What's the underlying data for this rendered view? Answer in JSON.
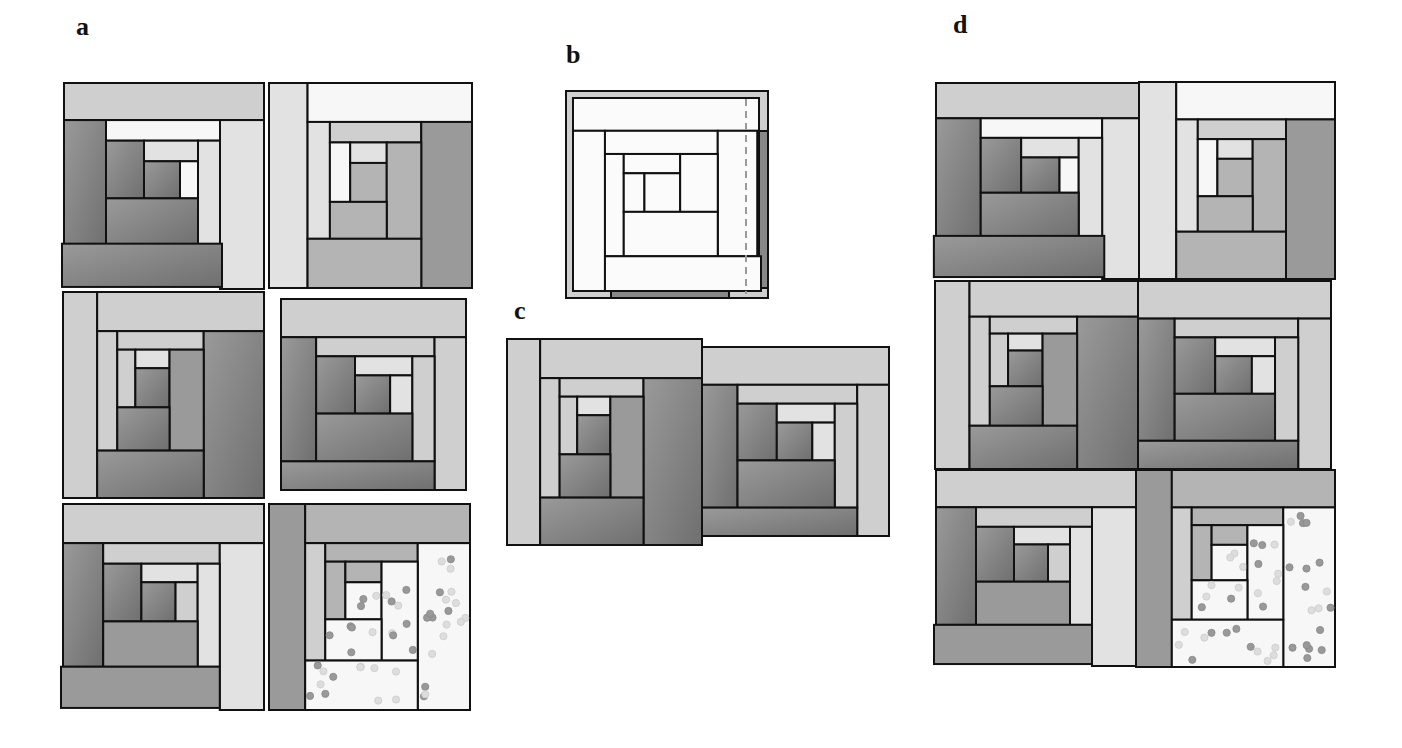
{
  "figure": {
    "labels": [
      {
        "id": "a",
        "text": "a",
        "x": 76,
        "y": 14
      },
      {
        "id": "b",
        "text": "b",
        "x": 566,
        "y": 42
      },
      {
        "id": "c",
        "text": "c",
        "x": 514,
        "y": 298
      },
      {
        "id": "d",
        "text": "d",
        "x": 953,
        "y": 12
      }
    ],
    "colors": {
      "white": "#f7f7f7",
      "pale": "#e2e2e2",
      "light": "#cfcfcf",
      "mid": "#b4b4b4",
      "midDark": "#9a9a9a",
      "dark": "#858585",
      "darker": "#777777",
      "outline": "#111111",
      "dotDark": "#999999",
      "dotLight": "#dddddd",
      "dashed": "#999999"
    },
    "panels": {
      "a": {
        "description": "Six individual log-cabin quilt blocks",
        "blocks": [
          {
            "name": "block-a1",
            "x": 64,
            "y": 83,
            "w": 200,
            "h": 206,
            "variant": "A"
          },
          {
            "name": "block-a2",
            "x": 269,
            "y": 83,
            "w": 203,
            "h": 205,
            "variant": "B"
          },
          {
            "name": "block-a3",
            "x": 63,
            "y": 292,
            "w": 201,
            "h": 206,
            "variant": "C"
          },
          {
            "name": "block-a4",
            "x": 281,
            "y": 299,
            "w": 185,
            "h": 191,
            "variant": "D"
          },
          {
            "name": "block-a5",
            "x": 63,
            "y": 504,
            "w": 201,
            "h": 206,
            "variant": "E"
          },
          {
            "name": "block-a6",
            "x": 269,
            "y": 504,
            "w": 201,
            "h": 206,
            "variant": "F"
          }
        ]
      },
      "b": {
        "description": "Single block outline with seam allowance and dashed cutting line",
        "x": 566,
        "y": 91,
        "w": 202,
        "h": 207
      },
      "c": {
        "description": "Two blocks joined side by side",
        "blocks": [
          {
            "name": "block-c1",
            "x": 507,
            "y": 339,
            "w": 195,
            "h": 206,
            "variant": "C"
          },
          {
            "name": "block-c2",
            "x": 702,
            "y": 347,
            "w": 187,
            "h": 189,
            "variant": "D"
          }
        ]
      },
      "d": {
        "description": "Six blocks assembled into a 2x3 quilt",
        "blocks": [
          {
            "name": "block-d1",
            "x": 936,
            "y": 83,
            "w": 213,
            "h": 196,
            "variant": "A"
          },
          {
            "name": "block-d2",
            "x": 1139,
            "y": 82,
            "w": 196,
            "h": 197,
            "variant": "B"
          },
          {
            "name": "block-d3",
            "x": 935,
            "y": 281,
            "w": 203,
            "h": 188,
            "variant": "C"
          },
          {
            "name": "block-d4",
            "x": 1138,
            "y": 281,
            "w": 193,
            "h": 188,
            "variant": "D"
          },
          {
            "name": "block-d5",
            "x": 936,
            "y": 470,
            "w": 200,
            "h": 196,
            "variant": "E"
          },
          {
            "name": "block-d6",
            "x": 1136,
            "y": 470,
            "w": 199,
            "h": 197,
            "variant": "F"
          }
        ]
      }
    },
    "variants": {
      "A": [
        [
          0,
          0,
          1,
          0.18,
          "light"
        ],
        [
          0,
          0.18,
          0.21,
          0.62,
          "darker"
        ],
        [
          0.21,
          0.18,
          0.57,
          0.1,
          "white"
        ],
        [
          0.78,
          0.18,
          0.22,
          0.82,
          "pale"
        ],
        [
          0.21,
          0.28,
          0.19,
          0.28,
          "dark"
        ],
        [
          0.4,
          0.28,
          0.27,
          0.1,
          "pale"
        ],
        [
          0.4,
          0.38,
          0.18,
          0.18,
          "dark"
        ],
        [
          0.58,
          0.38,
          0.09,
          0.18,
          "white"
        ],
        [
          0.67,
          0.28,
          0.11,
          0.52,
          "pale"
        ],
        [
          0.21,
          0.56,
          0.46,
          0.24,
          "dark"
        ],
        [
          -0.01,
          0.78,
          0.8,
          0.21,
          "darker"
        ]
      ],
      "B": [
        [
          0,
          0,
          0.19,
          1,
          "pale"
        ],
        [
          0.19,
          0,
          0.81,
          0.19,
          "white"
        ],
        [
          0.19,
          0.19,
          0.11,
          0.57,
          "pale"
        ],
        [
          0.3,
          0.19,
          0.45,
          0.1,
          "light"
        ],
        [
          0.75,
          0.19,
          0.25,
          0.81,
          "midDark"
        ],
        [
          0.3,
          0.29,
          0.1,
          0.29,
          "white"
        ],
        [
          0.4,
          0.29,
          0.18,
          0.1,
          "pale"
        ],
        [
          0.4,
          0.39,
          0.18,
          0.19,
          "mid"
        ],
        [
          0.58,
          0.29,
          0.17,
          0.47,
          "mid"
        ],
        [
          0.3,
          0.58,
          0.28,
          0.18,
          "mid"
        ],
        [
          0.19,
          0.76,
          0.56,
          0.24,
          "mid"
        ]
      ],
      "C": [
        [
          0,
          0,
          0.17,
          1,
          "light"
        ],
        [
          0.17,
          0,
          0.83,
          0.19,
          "light"
        ],
        [
          0.17,
          0.19,
          0.1,
          0.58,
          "light"
        ],
        [
          0.27,
          0.19,
          0.43,
          0.09,
          "light"
        ],
        [
          0.7,
          0.19,
          0.3,
          0.81,
          "dark"
        ],
        [
          0.27,
          0.28,
          0.09,
          0.28,
          "light"
        ],
        [
          0.36,
          0.28,
          0.17,
          0.09,
          "pale"
        ],
        [
          0.36,
          0.37,
          0.17,
          0.19,
          "dark"
        ],
        [
          0.53,
          0.28,
          0.17,
          0.49,
          "midDark"
        ],
        [
          0.27,
          0.56,
          0.26,
          0.21,
          "dark"
        ],
        [
          0.17,
          0.77,
          0.53,
          0.23,
          "dark"
        ]
      ],
      "D": [
        [
          0,
          0,
          1,
          0.2,
          "light"
        ],
        [
          0,
          0.2,
          0.19,
          0.65,
          "dark"
        ],
        [
          0.19,
          0.2,
          0.64,
          0.1,
          "light"
        ],
        [
          0.83,
          0.2,
          0.17,
          0.8,
          "light"
        ],
        [
          0.19,
          0.3,
          0.21,
          0.3,
          "dark"
        ],
        [
          0.4,
          0.3,
          0.31,
          0.1,
          "pale"
        ],
        [
          0.4,
          0.4,
          0.19,
          0.2,
          "dark"
        ],
        [
          0.59,
          0.4,
          0.12,
          0.2,
          "pale"
        ],
        [
          0.71,
          0.3,
          0.12,
          0.55,
          "light"
        ],
        [
          0.19,
          0.6,
          0.52,
          0.25,
          "dark"
        ],
        [
          0,
          0.85,
          0.83,
          0.15,
          "dark"
        ]
      ],
      "E": [
        [
          0,
          0,
          1,
          0.19,
          "light"
        ],
        [
          0,
          0.19,
          0.2,
          0.6,
          "darker"
        ],
        [
          0.2,
          0.19,
          0.58,
          0.1,
          "light"
        ],
        [
          0.78,
          0.19,
          0.22,
          0.81,
          "pale"
        ],
        [
          0.2,
          0.29,
          0.19,
          0.28,
          "dark"
        ],
        [
          0.39,
          0.29,
          0.28,
          0.09,
          "pale"
        ],
        [
          0.39,
          0.38,
          0.17,
          0.19,
          "dark"
        ],
        [
          0.56,
          0.38,
          0.11,
          0.19,
          "light"
        ],
        [
          0.67,
          0.29,
          0.11,
          0.5,
          "pale"
        ],
        [
          0.2,
          0.57,
          0.47,
          0.22,
          "midDark"
        ],
        [
          -0.01,
          0.79,
          0.79,
          0.2,
          "midDark"
        ]
      ],
      "F": [
        [
          0,
          0,
          0.18,
          1,
          "midDark"
        ],
        [
          0.18,
          0,
          0.82,
          0.19,
          "mid"
        ],
        [
          0.18,
          0.19,
          0.1,
          0.57,
          "light"
        ],
        [
          0.28,
          0.19,
          0.46,
          0.09,
          "mid"
        ],
        [
          0.74,
          0.19,
          0.26,
          0.81,
          "white",
          true
        ],
        [
          0.28,
          0.28,
          0.1,
          0.28,
          "mid"
        ],
        [
          0.38,
          0.28,
          0.18,
          0.1,
          "mid"
        ],
        [
          0.38,
          0.38,
          0.18,
          0.18,
          "white",
          true
        ],
        [
          0.56,
          0.28,
          0.18,
          0.48,
          "white",
          true
        ],
        [
          0.28,
          0.56,
          0.28,
          0.2,
          "white",
          true
        ],
        [
          0.18,
          0.76,
          0.56,
          0.24,
          "white",
          true
        ]
      ]
    }
  }
}
